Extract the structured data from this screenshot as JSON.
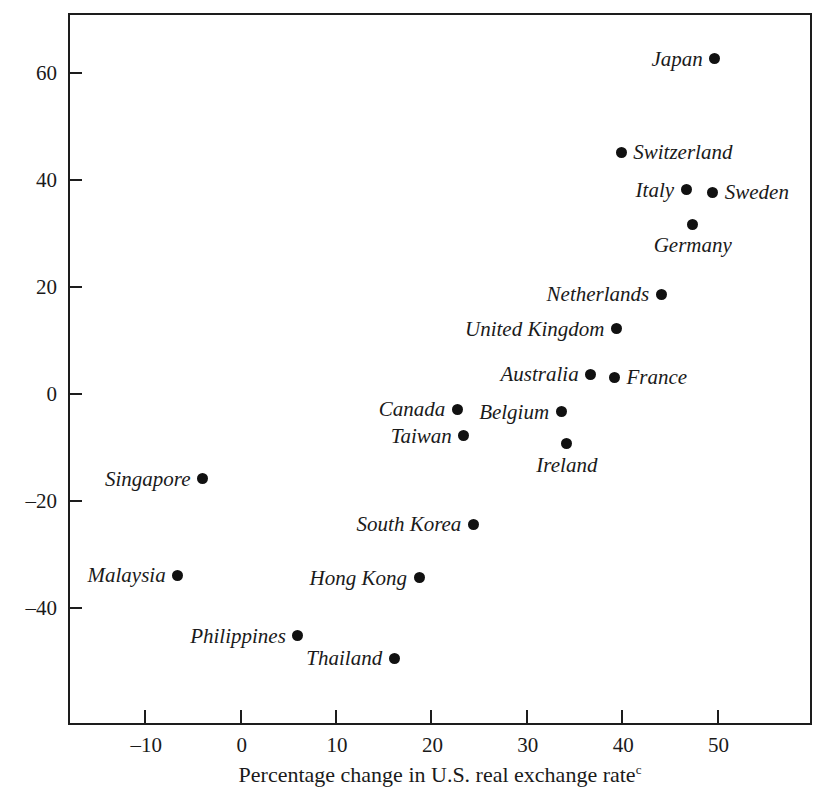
{
  "figure": {
    "cropped_caption": "",
    "background": "#ffffff",
    "ink_color": "#1a1a1a",
    "marker_color": "#111111"
  },
  "chart_data": {
    "type": "scatter",
    "title": "",
    "xlabel": "Percentage change in U.S. real exchange rate",
    "xlabel_superscript": "c",
    "ylabel": "",
    "xlim": [
      -18,
      60
    ],
    "ylim": [
      -62,
      71
    ],
    "xticks": [
      -10,
      0,
      10,
      20,
      30,
      40,
      50
    ],
    "xtick_labels": [
      "–10",
      "0",
      "10",
      "20",
      "30",
      "40",
      "50"
    ],
    "yticks": [
      60,
      40,
      20,
      0,
      -20,
      -40
    ],
    "ytick_labels": [
      "60",
      "40",
      "20",
      "0",
      "–20",
      "–40"
    ],
    "grid": false,
    "legend": "none",
    "marker": "filled-circle",
    "points": [
      {
        "label": "Japan",
        "x": 49.8,
        "y": 62.5,
        "label_pos": "left"
      },
      {
        "label": "Switzerland",
        "x": 40.0,
        "y": 45.0,
        "label_pos": "right"
      },
      {
        "label": "Italy",
        "x": 46.8,
        "y": 38.0,
        "label_pos": "left"
      },
      {
        "label": "Sweden",
        "x": 49.6,
        "y": 37.5,
        "label_pos": "right"
      },
      {
        "label": "Germany",
        "x": 47.5,
        "y": 31.5,
        "label_pos": "below"
      },
      {
        "label": "Netherlands",
        "x": 44.2,
        "y": 18.5,
        "label_pos": "left"
      },
      {
        "label": "United Kingdom",
        "x": 39.5,
        "y": 12.0,
        "label_pos": "left"
      },
      {
        "label": "Australia",
        "x": 36.8,
        "y": 3.5,
        "label_pos": "left"
      },
      {
        "label": "France",
        "x": 39.3,
        "y": 3.0,
        "label_pos": "right"
      },
      {
        "label": "Canada",
        "x": 22.8,
        "y": -3.0,
        "label_pos": "left"
      },
      {
        "label": "Belgium",
        "x": 33.7,
        "y": -3.5,
        "label_pos": "left"
      },
      {
        "label": "Taiwan",
        "x": 23.5,
        "y": -8.0,
        "label_pos": "left"
      },
      {
        "label": "Ireland",
        "x": 34.3,
        "y": -9.5,
        "label_pos": "below"
      },
      {
        "label": "Singapore",
        "x": -3.9,
        "y": -16.0,
        "label_pos": "left"
      },
      {
        "label": "South Korea",
        "x": 24.5,
        "y": -24.5,
        "label_pos": "left"
      },
      {
        "label": "Malaysia",
        "x": -6.5,
        "y": -34.0,
        "label_pos": "left"
      },
      {
        "label": "Hong Kong",
        "x": 18.8,
        "y": -34.5,
        "label_pos": "left"
      },
      {
        "label": "Philippines",
        "x": 6.1,
        "y": -45.3,
        "label_pos": "left"
      },
      {
        "label": "Thailand",
        "x": 16.2,
        "y": -49.5,
        "label_pos": "left"
      }
    ]
  }
}
